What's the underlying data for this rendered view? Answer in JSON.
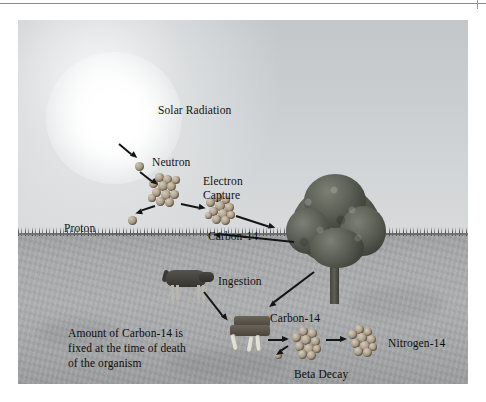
{
  "figure": {
    "labels": {
      "solar_radiation": "Solar Radiation",
      "neutron": "Neutron",
      "proton": "Proton",
      "electron_capture_line1": "Electron",
      "electron_capture_line2": "Capture",
      "carbon14_air": "Carbon-14",
      "ingestion": "Ingestion",
      "carbon14_ground": "Carbon-14",
      "nitrogen14": "Nitrogen-14",
      "beta_decay": "Beta Decay",
      "fixed_note_line1": "Amount of Carbon-14 is",
      "fixed_note_line2": "fixed at the time of death",
      "fixed_note_line3": "of the organism"
    },
    "scene": {
      "sun": "sun-glow",
      "tree": "tree",
      "cow": "cow",
      "carcass": "dead-organism",
      "ground": "ground",
      "sky": "sky",
      "horizon": "horizon-line"
    },
    "colors": {
      "sky": "#c9cdd0",
      "ground": "#a7a9aa",
      "tree": "#4a4d44",
      "particle": "#b0a28c",
      "text": "#111111",
      "arrow": "#141414",
      "sun": "#ffffff"
    }
  }
}
